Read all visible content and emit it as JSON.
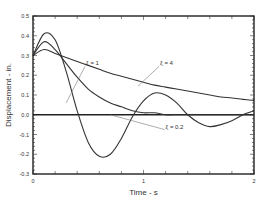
{
  "chart_data": {
    "type": "line",
    "title": "",
    "xlabel": "Time - s",
    "ylabel": "Displacement - in.",
    "xlim": [
      0,
      2
    ],
    "ylim": [
      -0.3,
      0.5
    ],
    "xticks": [
      "0",
      "1",
      "2"
    ],
    "yticks": [
      "0.5",
      "0.4",
      "0.3",
      "0.2",
      "0.1",
      "0.0",
      "-0.1",
      "-0.2",
      "-0.3"
    ],
    "grid": false,
    "x": [
      0,
      0.1,
      0.2,
      0.3,
      0.4,
      0.5,
      0.6,
      0.7,
      0.8,
      0.9,
      1.0,
      1.1,
      1.2,
      1.3,
      1.4,
      1.5,
      1.6,
      1.7,
      1.8,
      1.9,
      2.0
    ],
    "series": [
      {
        "name": "ξ = 0.2",
        "values": [
          0.3,
          0.41,
          0.38,
          0.22,
          0.02,
          -0.14,
          -0.21,
          -0.2,
          -0.12,
          -0.01,
          0.07,
          0.11,
          0.1,
          0.06,
          0.0,
          -0.04,
          -0.06,
          -0.05,
          -0.03,
          0.0,
          0.02
        ]
      },
      {
        "name": "ξ = 1",
        "values": [
          0.3,
          0.37,
          0.33,
          0.26,
          0.19,
          0.13,
          0.09,
          0.06,
          0.04,
          0.02,
          0.01,
          0.01,
          0.0,
          0.0,
          0.0,
          0.0,
          0.0,
          0.0,
          0.0,
          0.0,
          0.0
        ]
      },
      {
        "name": "ξ = 4",
        "values": [
          0.3,
          0.33,
          0.31,
          0.29,
          0.27,
          0.25,
          0.23,
          0.21,
          0.195,
          0.18,
          0.165,
          0.15,
          0.14,
          0.13,
          0.12,
          0.11,
          0.1,
          0.09,
          0.085,
          0.078,
          0.072
        ]
      }
    ],
    "annotations": [
      {
        "text": "ξ = 4",
        "x": 1.15,
        "y": 0.25,
        "arrow_to": [
          0.95,
          0.145
        ]
      },
      {
        "text": "ξ = 1",
        "x": 0.48,
        "y": 0.25,
        "arrow_to": [
          0.3,
          0.06
        ]
      },
      {
        "text": "ξ = 0.2",
        "x": 1.2,
        "y": -0.07,
        "arrow_to": [
          0.7,
          -0.0
        ]
      }
    ],
    "legend": "none (inline annotations)"
  }
}
